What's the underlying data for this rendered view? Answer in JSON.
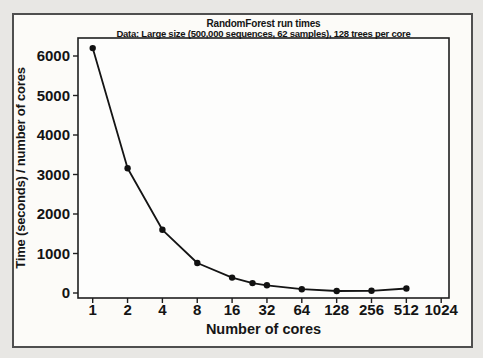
{
  "figure": {
    "title": "RandomForest run times",
    "subtitle": "Data: Large size (500,000 sequences, 62 samples), 128 trees per core"
  },
  "chart_data": {
    "type": "line",
    "title": "RandomForest run times",
    "subtitle": "Data: Large size (500,000 sequences, 62 samples), 128 trees per core",
    "xlabel": "Number of cores",
    "ylabel": "Time (seconds) / number of cores",
    "x_scale": "log2",
    "x_ticks": [
      1,
      2,
      4,
      8,
      16,
      32,
      64,
      128,
      256,
      512,
      1024
    ],
    "y_ticks": [
      0,
      1000,
      2000,
      3000,
      4000,
      5000,
      6000
    ],
    "ylim": [
      0,
      6450
    ],
    "grid": false,
    "legend": false,
    "series": [
      {
        "name": "time-per-core",
        "marker": "filled-circle",
        "color": "#141414",
        "x": [
          1,
          2,
          4,
          8,
          16,
          24,
          32,
          64,
          128,
          256,
          512
        ],
        "y": [
          6200,
          3160,
          1600,
          760,
          390,
          250,
          195,
          95,
          50,
          55,
          115
        ]
      }
    ]
  },
  "colors": {
    "page_background": "#e8e7e4",
    "figure_background": "#fcfbf8",
    "figure_border": "#4f4f4f",
    "plot_background": "#fdfdfc",
    "axis_frame": "#1f1f1f",
    "line": "#141414",
    "marker": "#111111",
    "text": "#141414"
  }
}
